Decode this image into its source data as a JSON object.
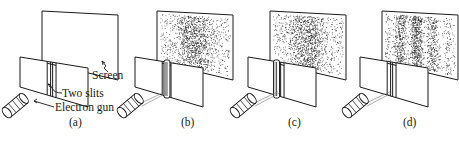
{
  "figure": {
    "colors": {
      "ink": "#1a1a1a",
      "paper": "#ffffff"
    },
    "annotations": {
      "screen": "Screen",
      "two_slits": "Two slits",
      "electron_gun": "Electron gun"
    },
    "panels": [
      {
        "id": "a",
        "label": "(a)",
        "screen_pattern": "empty"
      },
      {
        "id": "b",
        "label": "(b)",
        "screen_pattern": "single-broad-distribution",
        "slit_covered": "right"
      },
      {
        "id": "c",
        "label": "(c)",
        "screen_pattern": "single-broad-distribution",
        "slit_covered": "left"
      },
      {
        "id": "d",
        "label": "(d)",
        "screen_pattern": "interference-fringes",
        "slit_covered": "none"
      }
    ]
  }
}
